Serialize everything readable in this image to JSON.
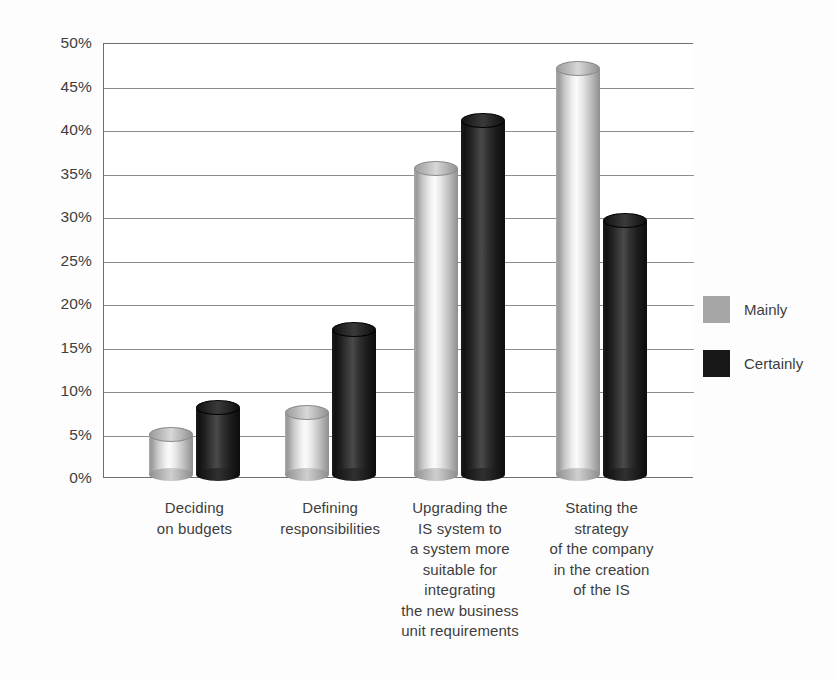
{
  "chart_data": {
    "type": "bar",
    "title": "",
    "subtitle": "",
    "xlabel": "",
    "ylabel": "",
    "ylim": [
      0,
      50
    ],
    "y_tick_labels": [
      "50%",
      "45%",
      "40%",
      "35%",
      "30%",
      "25%",
      "20%",
      "15%",
      "10%",
      "5%",
      "0%"
    ],
    "y_tick_values": [
      50,
      45,
      40,
      35,
      30,
      25,
      20,
      15,
      10,
      5,
      0
    ],
    "grid": "horizontal",
    "legend_position": "right",
    "value_unit": "%",
    "categories": [
      "Deciding\non budgets",
      "Defining\nresponsibilities",
      "Upgrading the\nIS system to\na system more\nsuitable for\nintegrating\nthe new business\nunit requirements",
      "Stating the\nstrategy\nof the company\nin the creation\nof the IS"
    ],
    "series": [
      {
        "name": "Mainly",
        "color": "#a6a6a6",
        "values": [
          5,
          7.5,
          35.5,
          47
        ]
      },
      {
        "name": "Certainly",
        "color": "#181818",
        "values": [
          8,
          17,
          41,
          29.5
        ]
      }
    ]
  },
  "legend": {
    "items": [
      {
        "label": "Mainly",
        "swatch": "light"
      },
      {
        "label": "Certainly",
        "swatch": "dark"
      }
    ]
  }
}
